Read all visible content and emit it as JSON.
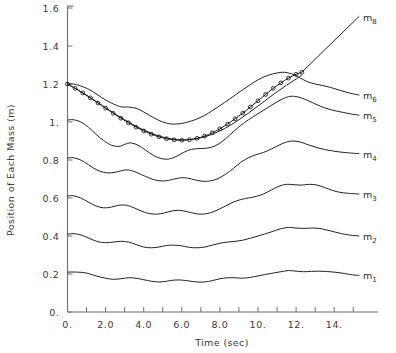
{
  "chart_data": {
    "type": "line",
    "title": "",
    "xlabel": "Time (sec)",
    "ylabel": "Position of Each Mass (m)",
    "xlim": [
      0,
      15.4
    ],
    "ylim": [
      0,
      1.6
    ],
    "grid": false,
    "legend_position": "right-inline-labels",
    "xticks": [
      0,
      1,
      2,
      3,
      4,
      5,
      6,
      7,
      8,
      9,
      10,
      11,
      12,
      13,
      14,
      15
    ],
    "xticklabels": [
      "0.",
      "",
      "2.0",
      "",
      "4.0",
      "",
      "6.0",
      "",
      "8.0",
      "",
      "10.",
      "",
      "12.",
      "",
      "14.",
      ""
    ],
    "yticks": [
      0,
      0.2,
      0.4,
      0.6,
      0.8,
      1.0,
      1.2,
      1.4,
      1.6
    ],
    "yticklabels": [
      "0.",
      "0.2",
      "0.4",
      "0.6",
      "0.8",
      "1.",
      "1.2",
      "1.4",
      "1.6"
    ],
    "series": [
      {
        "name": "m8",
        "label_base": "m",
        "label_sub": "8",
        "marker": "circle",
        "note": "curve with open-circle markers from t=0 to t=12.3, then straight rising line to t=15.3",
        "x": [
          0.0,
          0.4,
          0.8,
          1.2,
          1.6,
          2.0,
          2.4,
          2.8,
          3.2,
          3.6,
          4.0,
          4.4,
          4.8,
          5.2,
          5.6,
          6.0,
          6.4,
          6.8,
          7.2,
          7.6,
          8.0,
          8.4,
          8.8,
          9.2,
          9.6,
          10.0,
          10.4,
          10.8,
          11.2,
          11.6,
          12.0,
          12.3
        ],
        "y": [
          1.2,
          1.177,
          1.153,
          1.127,
          1.1,
          1.073,
          1.046,
          1.02,
          0.996,
          0.973,
          0.953,
          0.936,
          0.922,
          0.912,
          0.906,
          0.904,
          0.907,
          0.914,
          0.926,
          0.943,
          0.964,
          0.989,
          1.017,
          1.047,
          1.079,
          1.112,
          1.145,
          1.177,
          1.206,
          1.231,
          1.251,
          1.262
        ],
        "line_tail_x": [
          12.3,
          15.3
        ],
        "line_tail_y": [
          1.262,
          1.555
        ]
      },
      {
        "name": "m7",
        "label_base": "",
        "label_sub": "",
        "marker": "none",
        "note": "overlapping smooth curve drawn under the m8 marker curve",
        "x": [
          0.0,
          0.5,
          1.0,
          1.5,
          2.0,
          2.5,
          3.0,
          3.5,
          4.0,
          4.5,
          5.0,
          5.5,
          6.0,
          6.5,
          7.0,
          7.5,
          8.0,
          8.5,
          9.0,
          9.5,
          10.0,
          10.5,
          11.0,
          11.5,
          12.0,
          12.3
        ],
        "y": [
          1.2,
          1.172,
          1.141,
          1.108,
          1.075,
          1.042,
          1.012,
          0.983,
          0.958,
          0.937,
          0.921,
          0.911,
          0.906,
          0.908,
          0.917,
          0.932,
          0.953,
          0.98,
          1.012,
          1.047,
          1.084,
          1.122,
          1.159,
          1.194,
          1.226,
          1.248
        ]
      },
      {
        "name": "m6",
        "label_base": "m",
        "label_sub": "6",
        "marker": "none",
        "x": [
          0.0,
          0.3,
          0.8,
          1.3,
          1.8,
          2.3,
          2.8,
          3.2,
          3.6,
          4.0,
          4.5,
          5.0,
          5.4,
          5.8,
          6.2,
          6.7,
          7.2,
          7.6,
          8.0,
          8.5,
          9.0,
          9.5,
          10.0,
          10.5,
          11.0,
          11.4,
          11.8,
          12.2,
          12.6,
          13.0,
          13.4,
          13.8,
          14.2,
          14.6,
          15.0,
          15.3
        ],
        "y": [
          1.2,
          1.2,
          1.186,
          1.162,
          1.128,
          1.1,
          1.08,
          1.079,
          1.072,
          1.053,
          1.024,
          1.0,
          0.99,
          0.99,
          0.997,
          1.012,
          1.035,
          1.06,
          1.086,
          1.12,
          1.156,
          1.19,
          1.222,
          1.245,
          1.258,
          1.262,
          1.252,
          1.232,
          1.212,
          1.2,
          1.192,
          1.182,
          1.17,
          1.158,
          1.148,
          1.142
        ]
      },
      {
        "name": "m5",
        "label_base": "m",
        "label_sub": "5",
        "marker": "none",
        "x": [
          0.0,
          0.3,
          0.7,
          1.1,
          1.5,
          1.9,
          2.3,
          2.7,
          3.0,
          3.3,
          3.7,
          4.1,
          4.5,
          4.9,
          5.3,
          5.7,
          6.1,
          6.5,
          6.9,
          7.3,
          7.7,
          8.1,
          8.5,
          8.9,
          9.3,
          9.7,
          10.1,
          10.5,
          10.9,
          11.3,
          11.7,
          12.1,
          12.5,
          12.9,
          13.3,
          13.7,
          14.1,
          14.5,
          14.9,
          15.3
        ],
        "y": [
          1.01,
          1.012,
          1.0,
          0.972,
          0.935,
          0.902,
          0.878,
          0.872,
          0.882,
          0.89,
          0.878,
          0.852,
          0.825,
          0.808,
          0.805,
          0.818,
          0.84,
          0.856,
          0.86,
          0.862,
          0.872,
          0.896,
          0.93,
          0.966,
          0.998,
          1.025,
          1.05,
          1.075,
          1.1,
          1.122,
          1.135,
          1.132,
          1.118,
          1.1,
          1.082,
          1.068,
          1.058,
          1.05,
          1.042,
          1.036
        ]
      },
      {
        "name": "m4",
        "label_base": "m",
        "label_sub": "4",
        "marker": "none",
        "x": [
          0.0,
          0.3,
          0.7,
          1.1,
          1.5,
          1.9,
          2.3,
          2.7,
          3.1,
          3.5,
          3.9,
          4.3,
          4.7,
          5.1,
          5.5,
          5.9,
          6.3,
          6.7,
          7.1,
          7.5,
          7.9,
          8.3,
          8.7,
          9.1,
          9.5,
          9.9,
          10.3,
          10.7,
          11.1,
          11.5,
          11.9,
          12.3,
          12.7,
          13.1,
          13.5,
          13.9,
          14.3,
          14.7,
          15.1,
          15.3
        ],
        "y": [
          0.81,
          0.812,
          0.8,
          0.775,
          0.75,
          0.735,
          0.732,
          0.74,
          0.748,
          0.74,
          0.722,
          0.705,
          0.692,
          0.69,
          0.697,
          0.706,
          0.705,
          0.695,
          0.688,
          0.69,
          0.702,
          0.725,
          0.755,
          0.788,
          0.812,
          0.828,
          0.84,
          0.858,
          0.878,
          0.895,
          0.9,
          0.892,
          0.878,
          0.865,
          0.855,
          0.848,
          0.842,
          0.838,
          0.835,
          0.834
        ]
      },
      {
        "name": "m3",
        "label_base": "m",
        "label_sub": "3",
        "marker": "none",
        "x": [
          0.0,
          0.3,
          0.7,
          1.1,
          1.5,
          1.9,
          2.3,
          2.7,
          3.1,
          3.5,
          3.9,
          4.3,
          4.7,
          5.1,
          5.5,
          5.9,
          6.3,
          6.7,
          7.1,
          7.5,
          7.9,
          8.3,
          8.7,
          9.1,
          9.5,
          9.9,
          10.3,
          10.7,
          11.1,
          11.5,
          11.9,
          12.3,
          12.7,
          13.1,
          13.5,
          13.9,
          14.3,
          14.7,
          15.1,
          15.3
        ],
        "y": [
          0.61,
          0.612,
          0.6,
          0.578,
          0.558,
          0.548,
          0.552,
          0.562,
          0.562,
          0.548,
          0.53,
          0.518,
          0.515,
          0.522,
          0.532,
          0.535,
          0.528,
          0.518,
          0.515,
          0.522,
          0.538,
          0.558,
          0.578,
          0.592,
          0.6,
          0.608,
          0.622,
          0.642,
          0.662,
          0.672,
          0.67,
          0.668,
          0.672,
          0.668,
          0.655,
          0.64,
          0.63,
          0.625,
          0.622,
          0.621
        ]
      },
      {
        "name": "m2",
        "label_base": "m",
        "label_sub": "2",
        "marker": "none",
        "x": [
          0.0,
          0.4,
          0.8,
          1.2,
          1.6,
          2.0,
          2.4,
          2.8,
          3.2,
          3.6,
          4.0,
          4.4,
          4.8,
          5.2,
          5.6,
          6.0,
          6.4,
          6.8,
          7.2,
          7.6,
          8.0,
          8.4,
          8.8,
          9.2,
          9.6,
          10.0,
          10.4,
          10.8,
          11.2,
          11.6,
          12.0,
          12.4,
          12.8,
          13.2,
          13.6,
          14.0,
          14.4,
          14.8,
          15.1,
          15.3
        ],
        "y": [
          0.41,
          0.412,
          0.402,
          0.385,
          0.37,
          0.365,
          0.368,
          0.372,
          0.368,
          0.355,
          0.342,
          0.338,
          0.342,
          0.35,
          0.352,
          0.348,
          0.34,
          0.338,
          0.342,
          0.352,
          0.362,
          0.368,
          0.372,
          0.378,
          0.388,
          0.4,
          0.412,
          0.425,
          0.438,
          0.445,
          0.442,
          0.44,
          0.442,
          0.44,
          0.432,
          0.422,
          0.412,
          0.405,
          0.402,
          0.4
        ]
      },
      {
        "name": "m1",
        "label_base": "m",
        "label_sub": "1",
        "marker": "none",
        "x": [
          0.0,
          0.5,
          1.0,
          1.5,
          2.0,
          2.4,
          2.8,
          3.2,
          3.6,
          4.0,
          4.4,
          4.8,
          5.2,
          5.6,
          6.0,
          6.4,
          6.8,
          7.2,
          7.6,
          8.0,
          8.4,
          8.8,
          9.2,
          9.6,
          10.0,
          10.4,
          10.8,
          11.2,
          11.6,
          12.0,
          12.4,
          12.8,
          13.2,
          13.6,
          14.0,
          14.4,
          14.8,
          15.1,
          15.3
        ],
        "y": [
          0.21,
          0.21,
          0.205,
          0.19,
          0.178,
          0.172,
          0.175,
          0.18,
          0.178,
          0.17,
          0.162,
          0.158,
          0.162,
          0.168,
          0.168,
          0.163,
          0.158,
          0.158,
          0.165,
          0.175,
          0.18,
          0.18,
          0.178,
          0.182,
          0.19,
          0.198,
          0.205,
          0.212,
          0.218,
          0.215,
          0.212,
          0.214,
          0.215,
          0.213,
          0.21,
          0.205,
          0.198,
          0.194,
          0.193
        ]
      }
    ]
  },
  "figure": {
    "background_color": "#ffffff",
    "axis_color": "#6e6e6e",
    "curve_color": "#232323",
    "text_color": "#3a3a3a"
  }
}
